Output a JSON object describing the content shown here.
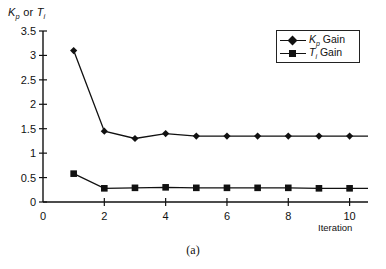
{
  "figure": {
    "caption": "(a)",
    "ylabel_k": "K",
    "ylabel_k_sub": "p",
    "ylabel_or": " or ",
    "ylabel_t": "T",
    "ylabel_t_sub": "i",
    "xlabel": "Iteration"
  },
  "legend": {
    "items": [
      {
        "label_main": "K",
        "label_sub": "p",
        "label_rest": " Gain",
        "marker": "diamond-marker"
      },
      {
        "label_main": "T",
        "label_sub": "i",
        "label_rest": " Gain",
        "marker": "square-marker"
      }
    ]
  },
  "chart_data": {
    "type": "line",
    "title": "",
    "xlabel": "Iteration",
    "ylabel": "Kp or Ti",
    "x": [
      1,
      2,
      3,
      4,
      5,
      6,
      7,
      8,
      9,
      10
    ],
    "xlim": [
      0,
      10.6
    ],
    "ylim": [
      0,
      3.5
    ],
    "xticks": [
      0,
      2,
      4,
      6,
      8,
      10
    ],
    "xtick_labels": [
      "0",
      "2",
      "4",
      "6",
      "8",
      "10"
    ],
    "yticks": [
      0,
      0.5,
      1,
      1.5,
      2,
      2.5,
      3,
      3.5
    ],
    "ytick_labels": [
      "0",
      "0.5",
      "1",
      "1.5",
      "2",
      "2.5",
      "3",
      "3.5"
    ],
    "grid": false,
    "legend_position": "top-right",
    "series": [
      {
        "name": "Kp Gain",
        "marker": "diamond",
        "color": "#111111",
        "values": [
          3.1,
          1.45,
          1.3,
          1.4,
          1.35,
          1.35,
          1.35,
          1.35,
          1.35,
          1.35
        ]
      },
      {
        "name": "Ti Gain",
        "marker": "square",
        "color": "#111111",
        "values": [
          0.58,
          0.28,
          0.29,
          0.3,
          0.29,
          0.29,
          0.29,
          0.29,
          0.28,
          0.28
        ]
      }
    ]
  }
}
